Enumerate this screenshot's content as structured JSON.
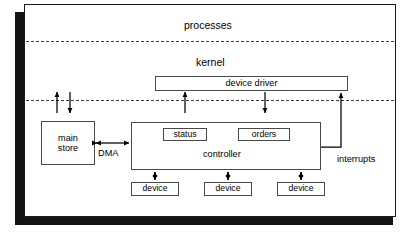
{
  "diagram": {
    "layers": [
      {
        "id": "processes",
        "label": "processes"
      },
      {
        "id": "kernel",
        "label": "kernel"
      }
    ],
    "boxes": {
      "device_driver": "device driver",
      "main_store_line1": "main",
      "main_store_line2": "store",
      "controller": "controller",
      "status": "status",
      "orders": "orders",
      "device1": "device",
      "device2": "device",
      "device3": "device"
    },
    "connectors": {
      "dma": "DMA",
      "interrupts": "interrupts"
    },
    "colors": {
      "ink": "#000000",
      "box_stroke": "#4a4a4a",
      "frame_stroke": "#1a1a1a",
      "shadow": "#141414",
      "dash": "#3b3b3b",
      "paper": "#ffffff"
    }
  }
}
